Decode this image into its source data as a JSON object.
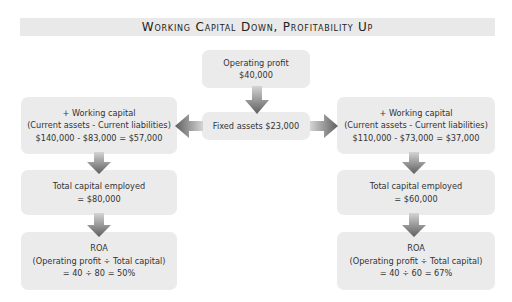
{
  "title": "Working Capital Down, Profitability Up",
  "colors": {
    "box_bg": "#ebebeb",
    "banner_bg": "#e8e8e8",
    "arrow": "#6e6e6e"
  },
  "center": {
    "operating_profit": {
      "lines": [
        "Operating profit",
        "$40,000"
      ]
    },
    "fixed_assets": {
      "lines": [
        "Fixed assets $23,000"
      ]
    }
  },
  "left": {
    "working_capital": {
      "lines": [
        "+ Working capital",
        "(Current assets - Current liabilities)",
        "$140,000 - $83,000 = $57,000"
      ]
    },
    "total_capital": {
      "lines": [
        "Total capital employed",
        "= $80,000"
      ]
    },
    "roa": {
      "lines": [
        "ROA",
        "(Operating profit ÷ Total capital)",
        "= 40 ÷ 80 = 50%"
      ]
    }
  },
  "right": {
    "working_capital": {
      "lines": [
        "+ Working capital",
        "(Current assets - Current liabilities)",
        "$110,000 - $73,000 = $37,000"
      ]
    },
    "total_capital": {
      "lines": [
        "Total capital employed",
        "= $60,000"
      ]
    },
    "roa": {
      "lines": [
        "ROA",
        "(Operating profit ÷ Total capital)",
        "= 40 ÷ 60 = 67%"
      ]
    }
  },
  "arrows": [
    {
      "name": "arrow-profit-to-fixed",
      "dir": "down"
    },
    {
      "name": "arrow-fixed-to-left-wc",
      "dir": "left"
    },
    {
      "name": "arrow-fixed-to-right-wc",
      "dir": "right"
    },
    {
      "name": "arrow-left-wc-to-tce",
      "dir": "down"
    },
    {
      "name": "arrow-left-tce-to-roa",
      "dir": "down"
    },
    {
      "name": "arrow-right-wc-to-tce",
      "dir": "down"
    },
    {
      "name": "arrow-right-tce-to-roa",
      "dir": "down"
    }
  ]
}
